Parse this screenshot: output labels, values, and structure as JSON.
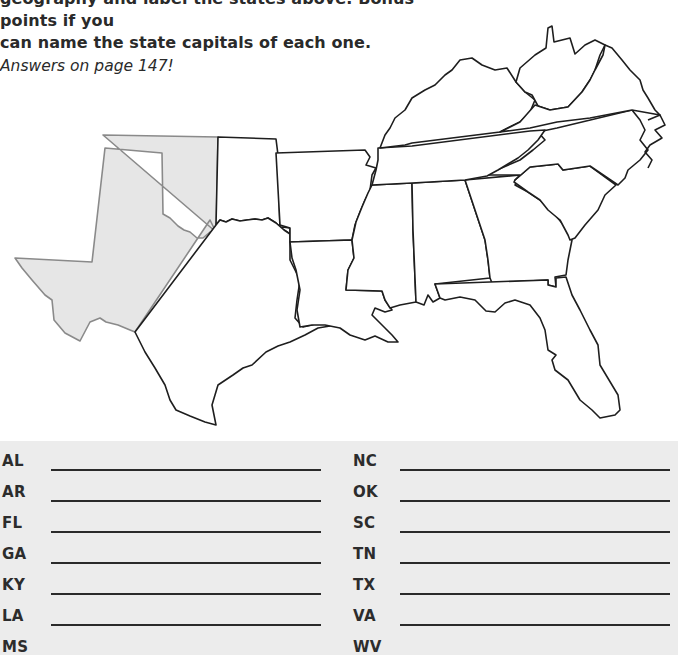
{
  "instructions": {
    "line1": "geography and label the states above. Bonus points if you",
    "line2": "can name the state capitals of each one.",
    "answers_note": "Answers on page 147!"
  },
  "map": {
    "title": "Southeastern United States outline map",
    "states_shown": [
      "TX",
      "OK",
      "AR",
      "LA",
      "MS",
      "AL",
      "GA",
      "FL",
      "SC",
      "NC",
      "TN",
      "KY",
      "VA",
      "WV"
    ],
    "shaded_region": "western Texas and Oklahoma panhandle",
    "shade_color": "#e6e6e6",
    "outline_color": "#1e1e1e"
  },
  "answer_sheet": {
    "background": "#ececec",
    "left_column": [
      {
        "abbr": "AL"
      },
      {
        "abbr": "AR"
      },
      {
        "abbr": "FL"
      },
      {
        "abbr": "GA"
      },
      {
        "abbr": "KY"
      },
      {
        "abbr": "LA"
      },
      {
        "abbr": "MS"
      }
    ],
    "right_column": [
      {
        "abbr": "NC"
      },
      {
        "abbr": "OK"
      },
      {
        "abbr": "SC"
      },
      {
        "abbr": "TN"
      },
      {
        "abbr": "TX"
      },
      {
        "abbr": "VA"
      },
      {
        "abbr": "WV"
      }
    ]
  }
}
